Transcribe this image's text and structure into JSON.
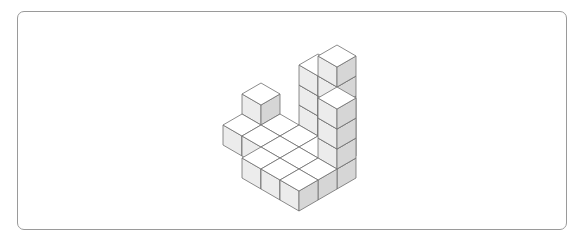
{
  "page": {
    "background_color": "#ffffff",
    "width": 581,
    "height": 245
  },
  "frame": {
    "name": "content-border",
    "x": 17,
    "y": 11,
    "width": 550,
    "height": 219,
    "corner_radius": 7,
    "stroke_color": "#9a9a9a",
    "stroke_width": 1,
    "fill_color": "#ffffff"
  },
  "figure": {
    "name": "isometric-block-figure",
    "projection": "isometric",
    "cube": {
      "half_width": 19,
      "half_depth": 11,
      "height": 20
    },
    "origin": {
      "x": 299,
      "y": 112
    },
    "colors": {
      "top_face": "#ffffff",
      "left_face": "#ececec",
      "right_face": "#d6d6d6",
      "edge_stroke": "#6e6e6e",
      "edge_width": 0.8
    },
    "grid": {
      "rows": 5,
      "cols": 5,
      "comment": "height_map[row][col] = number of stacked unit cubes at that grid cell; 0 means empty"
    },
    "height_map": [
      [
        0,
        0,
        0,
        0,
        0
      ],
      [
        0,
        0,
        4,
        5,
        0
      ],
      [
        2,
        1,
        1,
        1,
        4
      ],
      [
        1,
        1,
        1,
        1,
        1
      ],
      [
        0,
        0,
        1,
        1,
        1
      ]
    ],
    "cube_count": 24,
    "max_stack_height": 5,
    "min_stack_height": 1
  },
  "chart_data": {
    "type": "heatmap",
    "xlabel": "column",
    "ylabel": "row",
    "x": [
      0,
      1,
      2,
      3,
      4
    ],
    "y": [
      0,
      1,
      2,
      3,
      4
    ],
    "values": [
      [
        0,
        0,
        0,
        0,
        0
      ],
      [
        0,
        0,
        4,
        5,
        0
      ],
      [
        2,
        1,
        1,
        1,
        4
      ],
      [
        1,
        1,
        1,
        1,
        1
      ],
      [
        0,
        0,
        1,
        1,
        1
      ]
    ],
    "zlim": [
      0,
      5
    ],
    "grid": false,
    "legend": "none"
  }
}
